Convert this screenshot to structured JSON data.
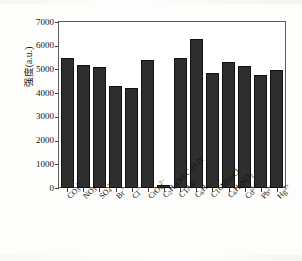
{
  "chart_data": {
    "type": "bar",
    "title": "",
    "xlabel": "",
    "ylabel": "强度(a.u.)",
    "ylim": [
      0,
      7000
    ],
    "ytick_values": [
      0,
      1000,
      2000,
      3000,
      4000,
      5000,
      6000,
      7000
    ],
    "ytick_labels": [
      "0",
      "1000",
      "2000",
      "3000",
      "4000",
      "5000",
      "6000",
      "7000"
    ],
    "grid": false,
    "legend": "none",
    "bar_color": "#2e2e2e",
    "categories": [
      "CO₃²⁻",
      "NO₃⁻",
      "SO₄²⁻",
      "Br⁻",
      "Cl⁻",
      "CrO₄²⁻",
      "C₂H₅OH/C₅H₅N",
      "CTAB",
      "C₆H₆",
      "C16MImCl",
      "C₆H₅NO₂",
      "Cd²⁺",
      "Pb²⁺",
      "Hg²⁺"
    ],
    "values": [
      5500,
      5190,
      5090,
      4290,
      4200,
      5390,
      120,
      5500,
      6270,
      4840,
      5300,
      5130,
      4780,
      4960
    ]
  }
}
